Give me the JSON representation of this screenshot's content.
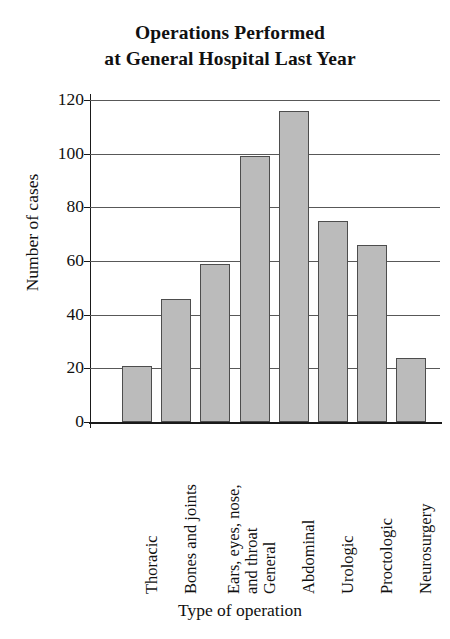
{
  "chart_data": {
    "type": "bar",
    "title": "Operations Performed at General Hospital Last Year",
    "title_lines": [
      "Operations Performed",
      "at General Hospital Last Year"
    ],
    "xlabel": "Type of operation",
    "ylabel": "Number of cases",
    "ylim": [
      0,
      120
    ],
    "ytick_step": 20,
    "yticks": [
      0,
      20,
      40,
      60,
      80,
      100,
      120
    ],
    "ytick_labels": [
      "0",
      "20",
      "40",
      "60",
      "80",
      "100",
      "120"
    ],
    "grid": true,
    "legend": "none",
    "bar_color": "#bbbbbb",
    "bar_edge_color": "#4d4d4d",
    "categories": [
      "Thoracic",
      "Bones and joints",
      "Ears, eyes, nose, and throat",
      "General",
      "Abdominal",
      "Urologic",
      "Proctologic",
      "Neurosurgery"
    ],
    "category_label_lines": [
      [
        "Thoracic"
      ],
      [
        "Bones and joints"
      ],
      [
        "Ears, eyes, nose,",
        "and throat"
      ],
      [
        "General"
      ],
      [
        "Abdominal"
      ],
      [
        "Urologic"
      ],
      [
        "Proctologic"
      ],
      [
        "Neurosurgery"
      ]
    ],
    "values": [
      21,
      46,
      59,
      99,
      116,
      75,
      66,
      24
    ]
  }
}
